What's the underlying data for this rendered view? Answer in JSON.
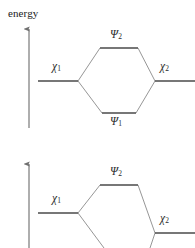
{
  "figure": {
    "width": 195,
    "height": 248,
    "background": "#ffffff",
    "axis_label": "energy",
    "colors": {
      "level_line": "#4a4a4a",
      "connector_line": "#8a8a8a",
      "arrow": "#9a9a9a",
      "text": "#2b2b2b"
    }
  },
  "diagrams": [
    {
      "id": "degenerate-interaction",
      "description": "Symmetric two-orbital interaction: two degenerate fragment orbitals chi-1 and chi-2 combine to give bonding psi-1 and antibonding psi-2.",
      "energy_arrow": {
        "label": "energy",
        "x": 29,
        "y_top": 28,
        "y_bottom": 128
      },
      "levels": [
        {
          "name": "chi-1",
          "label_base": "χ",
          "label_sub": "1",
          "x1": 38,
          "x2": 78,
          "y": 81,
          "label_x": 52,
          "label_y": 60,
          "label_anchor": "left"
        },
        {
          "name": "chi-2",
          "label_base": "χ",
          "label_sub": "2",
          "x1": 155,
          "x2": 195,
          "y": 81,
          "label_x": 160,
          "label_y": 60,
          "label_anchor": "left"
        },
        {
          "name": "psi-2",
          "label_base": "Ψ",
          "label_sub": "2",
          "x1": 100,
          "x2": 138,
          "y": 48,
          "label_x": 110,
          "label_y": 28,
          "label_anchor": "left"
        },
        {
          "name": "psi-1",
          "label_base": "Ψ",
          "label_sub": "1",
          "x1": 102,
          "x2": 136,
          "y": 113,
          "label_x": 110,
          "label_y": 115,
          "label_anchor": "left"
        }
      ],
      "connectors": [
        {
          "from": [
            78,
            81
          ],
          "to": [
            100,
            48
          ]
        },
        {
          "from": [
            138,
            48
          ],
          "to": [
            155,
            81
          ]
        },
        {
          "from": [
            78,
            81
          ],
          "to": [
            102,
            113
          ]
        },
        {
          "from": [
            136,
            113
          ],
          "to": [
            155,
            81
          ]
        }
      ]
    },
    {
      "id": "nondegenerate-interaction",
      "description": "Asymmetric two-orbital interaction: fragment orbital chi-1 lies above chi-2 in energy; the resulting psi-2 is the higher combination.",
      "energy_arrow": {
        "label": "",
        "x": 29,
        "y_top": 163,
        "y_bottom": 248
      },
      "levels": [
        {
          "name": "chi-1",
          "label_base": "χ",
          "label_sub": "1",
          "x1": 38,
          "x2": 78,
          "y": 213,
          "label_x": 52,
          "label_y": 192,
          "label_anchor": "left"
        },
        {
          "name": "chi-2",
          "label_base": "χ",
          "label_sub": "2",
          "x1": 155,
          "x2": 195,
          "y": 233,
          "label_x": 160,
          "label_y": 212,
          "label_anchor": "left"
        },
        {
          "name": "psi-2",
          "label_base": "Ψ",
          "label_sub": "2",
          "x1": 100,
          "x2": 138,
          "y": 185,
          "label_x": 110,
          "label_y": 165,
          "label_anchor": "left"
        }
      ],
      "connectors": [
        {
          "from": [
            78,
            213
          ],
          "to": [
            100,
            185
          ]
        },
        {
          "from": [
            138,
            185
          ],
          "to": [
            155,
            233
          ]
        },
        {
          "from": [
            78,
            213
          ],
          "to": [
            104,
            248
          ]
        },
        {
          "from": [
            150,
            248
          ],
          "to": [
            155,
            233
          ]
        }
      ]
    }
  ]
}
